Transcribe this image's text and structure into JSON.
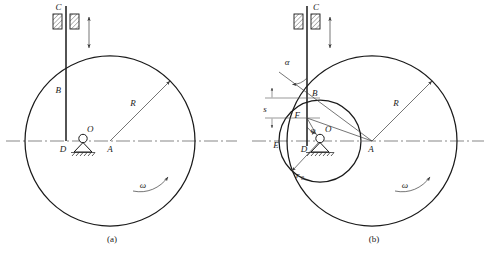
{
  "figure": {
    "background_color": "#ffffff",
    "line_color": "#1a1a1a",
    "panels": [
      {
        "id": "a",
        "caption": "(a)",
        "description": "Eccentric circular cam of radius R pivoted at O with flat/knife follower rod C-B-D moving vertically",
        "labels": {
          "follower_top": "C",
          "contact_point": "B",
          "rod_foot": "D",
          "pivot": "O",
          "cam_center": "A",
          "radius": "R",
          "angular_velocity": "ω"
        }
      },
      {
        "id": "b",
        "caption": "(b)",
        "description": "Same cam shown with base circle r0, displacement s, pressure angle alpha and cam angle phi",
        "labels": {
          "follower_top": "C",
          "contact_point": "B",
          "base_circle_point": "F",
          "rod_foot": "D",
          "left_extreme": "E",
          "pivot": "O",
          "cam_center": "A",
          "radius": "R",
          "base_radius": "r₀",
          "base_radius_main": "r",
          "base_radius_sub": "0",
          "displacement": "s",
          "pressure_angle": "α",
          "cam_angle": "φ",
          "angular_velocity": "ω"
        }
      }
    ],
    "icons": {
      "guide_block": "hatched-guide-block",
      "pivot_support": "pin-support-triangle",
      "ground": "ground-hatching",
      "motion_arrow": "double-headed-vertical-arrow",
      "rotation_arrow": "curved-rotation-arrow",
      "dimension_arrow": "dimension-arrow"
    }
  }
}
